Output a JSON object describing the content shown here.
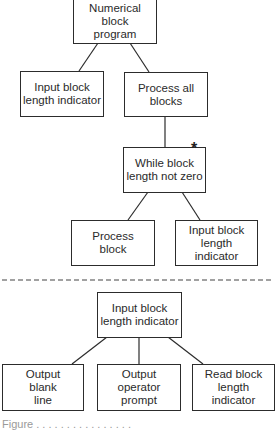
{
  "diagram": {
    "type": "structure-chart",
    "upper_tree": {
      "root": {
        "id": "numerical-block-program",
        "label": "Numerical\nblock\nprogram"
      },
      "level1": [
        {
          "id": "input-block-length-indicator-1",
          "label": "Input block\nlength indicator"
        },
        {
          "id": "process-all-blocks",
          "label": "Process all\nblocks"
        }
      ],
      "level2": [
        {
          "id": "while-block-length-not-zero",
          "label": "While block\nlength not zero",
          "iteration_marker": "*"
        }
      ],
      "level3": [
        {
          "id": "process-block",
          "label": "Process\nblock"
        },
        {
          "id": "input-block-length-indicator-2",
          "label": "Input block\nlength indicator"
        }
      ]
    },
    "separator": "dashed",
    "lower_tree": {
      "root": {
        "id": "input-block-length-indicator-3",
        "label": "Input block\nlength indicator"
      },
      "children": [
        {
          "id": "output-blank-line",
          "label": "Output\nblank\nline"
        },
        {
          "id": "output-operator-prompt",
          "label": "Output\noperator\nprompt"
        },
        {
          "id": "read-block-length-indicator",
          "label": "Read block\nlength\nindicator"
        }
      ]
    },
    "caption": "Figure . . . . . . . . . . . . . . . ."
  },
  "colors": {
    "line": "#2c2c2c",
    "background": "#ffffff",
    "caption": "#9a9a9a"
  }
}
